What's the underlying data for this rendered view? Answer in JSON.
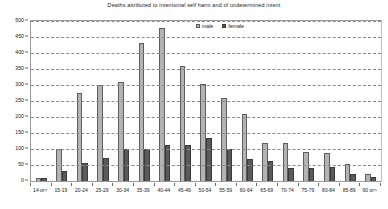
{
  "chart_data": {
    "type": "bar",
    "title": "Deaths attributed to intentional self harm and of undetermined intent",
    "xlabel": "",
    "ylabel": "",
    "ylim": [
      0,
      500
    ],
    "ytick_step": 50,
    "yticks": [
      "0",
      "50",
      "100",
      "150",
      "200",
      "250",
      "300",
      "350",
      "400",
      "450",
      "500"
    ],
    "grid": true,
    "legend_position": "top-center",
    "categories": [
      "14 or<",
      "15-19",
      "20-24",
      "25-29",
      "30-34",
      "35-39",
      "40-44",
      "45-49",
      "50-54",
      "55-59",
      "60-64",
      "65-69",
      "70-74",
      "75-79",
      "80-84",
      "85-89",
      "90 or>"
    ],
    "series": [
      {
        "name": "male",
        "color": "#b3b3b3",
        "values": [
          10,
          100,
          275,
          300,
          310,
          430,
          478,
          360,
          302,
          260,
          208,
          120,
          120,
          90,
          88,
          52,
          22
        ]
      },
      {
        "name": "female",
        "color": "#5a5a5a",
        "values": [
          8,
          30,
          55,
          72,
          100,
          100,
          112,
          112,
          135,
          100,
          68,
          62,
          42,
          42,
          45,
          22,
          14
        ]
      }
    ]
  }
}
